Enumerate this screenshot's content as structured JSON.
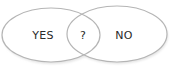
{
  "diagram": {
    "type": "venn",
    "sets": [
      {
        "label": "YES",
        "center": [
          42,
          35
        ]
      },
      {
        "label": "NO",
        "center": [
          124,
          35
        ]
      }
    ],
    "intersection": {
      "label": "?",
      "center": [
        83,
        34
      ]
    },
    "colors": {
      "stroke": "#b8b8b8",
      "fill": "#ffffff",
      "text": "#2a2a2a",
      "shadow": "#dcdcdc"
    }
  }
}
